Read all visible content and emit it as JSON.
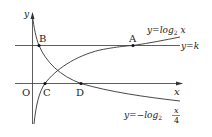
{
  "diagram": {
    "axes": {
      "x_label": "x",
      "y_label": "y",
      "origin_label": "O"
    },
    "curves": [
      {
        "name": "log2",
        "label_prefix": "y=log",
        "label_sub": "2",
        "label_suffix": " x"
      },
      {
        "name": "neg-log2-x-over-4",
        "label_prefix": "y=−log",
        "label_sub": "2",
        "frac_num": "x",
        "frac_den": "4"
      }
    ],
    "line": {
      "label": "y=k"
    },
    "points": [
      {
        "label": "A"
      },
      {
        "label": "B"
      },
      {
        "label": "C"
      },
      {
        "label": "D"
      }
    ]
  }
}
